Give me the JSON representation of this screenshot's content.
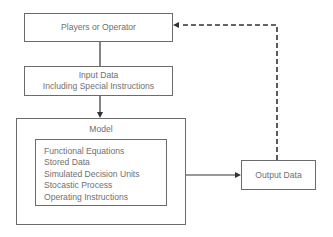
{
  "diagram": {
    "players_box": {
      "label": "Players or Operator"
    },
    "input_box": {
      "line1": "Input Data",
      "line2": "Including Special Instructions"
    },
    "model_box": {
      "title": "Model",
      "items": [
        "Functional Equations",
        "Stored Data",
        "Simulated Decision Units",
        "Stocastic Process",
        "Operating Instructions"
      ]
    },
    "output_box": {
      "label": "Output Data"
    },
    "connections": [
      {
        "from": "Players or Operator",
        "to": "Input Data",
        "style": "solid"
      },
      {
        "from": "Input Data",
        "to": "Model",
        "style": "solid-arrow"
      },
      {
        "from": "Model",
        "to": "Output Data",
        "style": "solid-arrow"
      },
      {
        "from": "Output Data",
        "to": "Players or Operator",
        "style": "dashed-arrow"
      }
    ]
  }
}
